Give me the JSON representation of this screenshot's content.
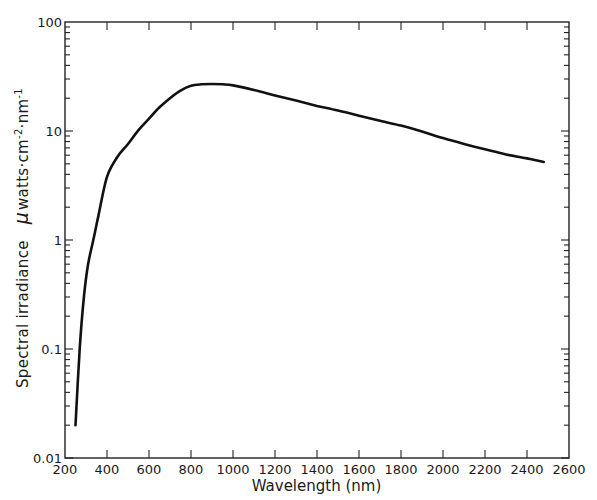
{
  "chart_data": {
    "type": "line",
    "title": "",
    "xlabel": "Wavelength (nm)",
    "ylabel": {
      "text": "Spectral irradiance",
      "unit_prefix": "μ",
      "unit_main": "watts·cm",
      "unit_exp1": "-2",
      "unit_mid": "·nm",
      "unit_exp2": "-1"
    },
    "xlim": [
      200,
      2600
    ],
    "ylim": [
      0.01,
      100
    ],
    "yscale": "log",
    "grid": false,
    "legend": null,
    "x_ticks": [
      200,
      400,
      600,
      800,
      1000,
      1200,
      1400,
      1600,
      1800,
      2000,
      2200,
      2400,
      2600
    ],
    "x_tick_labels": [
      "200",
      "400",
      "600",
      "800",
      "1000",
      "1200",
      "1400",
      "1600",
      "1800",
      "2000",
      "2200",
      "2400",
      "2600"
    ],
    "y_ticks": [
      0.01,
      0.1,
      1,
      10,
      100
    ],
    "y_tick_labels": [
      "0.01",
      "0.1",
      "1",
      "10",
      "100"
    ],
    "series": [
      {
        "name": "Spectral irradiance",
        "color": "#111111",
        "x": [
          250,
          270,
          290,
          310,
          335,
          360,
          400,
          450,
          500,
          550,
          600,
          650,
          700,
          750,
          800,
          850,
          900,
          950,
          1000,
          1100,
          1200,
          1300,
          1400,
          1500,
          1600,
          1700,
          1800,
          1900,
          2000,
          2100,
          2200,
          2300,
          2400,
          2480
        ],
        "values": [
          0.02,
          0.1,
          0.3,
          0.6,
          1.0,
          1.7,
          3.8,
          5.8,
          7.6,
          10.2,
          13.0,
          16.5,
          20.0,
          23.5,
          26.0,
          26.8,
          27.0,
          26.8,
          26.2,
          23.8,
          21.2,
          19.0,
          17.0,
          15.4,
          13.8,
          12.4,
          11.2,
          9.9,
          8.6,
          7.6,
          6.8,
          6.1,
          5.6,
          5.2
        ]
      }
    ]
  }
}
